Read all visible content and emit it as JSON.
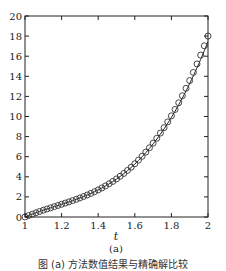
{
  "chart_data": {
    "type": "line",
    "title": "",
    "xlabel": "t",
    "ylabel": "",
    "subfigure_label": "(a)",
    "xlim": [
      1,
      2
    ],
    "ylim": [
      0,
      20
    ],
    "xticks": [
      1,
      1.2,
      1.4,
      1.6,
      1.8,
      2
    ],
    "xtick_labels": [
      "1",
      "1.2",
      "1.4",
      "1.6",
      "1.8",
      "2"
    ],
    "yticks": [
      0,
      2,
      4,
      6,
      8,
      10,
      12,
      14,
      16,
      18,
      20
    ],
    "ytick_labels": [
      "0",
      "2",
      "4",
      "6",
      "8",
      "10",
      "12",
      "14",
      "16",
      "18",
      "20"
    ],
    "grid": false,
    "legend": null,
    "series": [
      {
        "name": "exact solution",
        "style": "solid line",
        "x": [
          1,
          1.1,
          1.2,
          1.3,
          1.4,
          1.5,
          1.6,
          1.7,
          1.8,
          1.9,
          2
        ],
        "values": [
          0,
          0.66,
          1.26,
          1.93,
          2.75,
          3.83,
          5.26,
          7.14,
          9.57,
          12.64,
          16.3
        ]
      },
      {
        "name": "numerical solution",
        "style": "open circle markers",
        "x": [
          1,
          1.1,
          1.2,
          1.3,
          1.4,
          1.5,
          1.6,
          1.7,
          1.8,
          1.9,
          2
        ],
        "values": [
          0,
          0.66,
          1.26,
          1.93,
          2.75,
          3.83,
          5.26,
          7.14,
          9.57,
          12.64,
          18.0
        ]
      }
    ]
  },
  "caption": "图 (a) 方法数值结果与精确解比较"
}
